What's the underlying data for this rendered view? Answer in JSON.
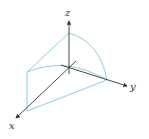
{
  "diagram": {
    "type": "3d-coordinate-solid",
    "axes": {
      "x": {
        "label": "x"
      },
      "y": {
        "label": "y"
      },
      "z": {
        "label": "z"
      }
    },
    "colors": {
      "axis": "#333333",
      "surface": "#7ec8e3",
      "background": "#ffffff"
    }
  }
}
